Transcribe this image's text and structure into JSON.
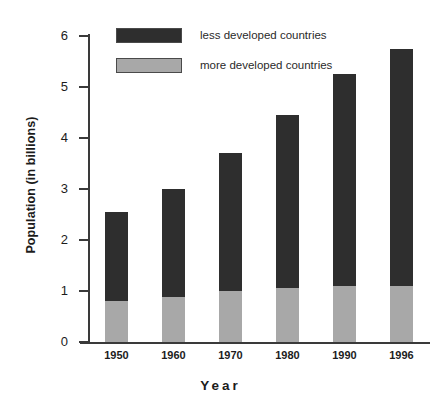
{
  "chart_data": {
    "type": "bar",
    "subtype": "stacked",
    "title": "",
    "xlabel": "Year",
    "ylabel": "Population (in billions)",
    "categories": [
      "1950",
      "1960",
      "1970",
      "1980",
      "1990",
      "1996"
    ],
    "ylim": [
      0,
      6
    ],
    "yticks": [
      "0",
      "1",
      "2",
      "3",
      "4",
      "5",
      "6"
    ],
    "grid": false,
    "legend_position": "top-left",
    "series": [
      {
        "name": "more developed countries",
        "color": "#a8a8a8",
        "values": [
          0.8,
          0.88,
          1.0,
          1.05,
          1.1,
          1.1
        ]
      },
      {
        "name": "less developed countries",
        "color": "#2e2e2e",
        "values": [
          1.75,
          2.12,
          2.7,
          3.4,
          4.15,
          4.65
        ]
      }
    ],
    "totals": [
      2.55,
      3.0,
      3.7,
      4.45,
      5.25,
      5.75
    ]
  },
  "legend": {
    "items": [
      {
        "label": "less developed countries",
        "color": "#2e2e2e"
      },
      {
        "label": "more developed countries",
        "color": "#a8a8a8"
      }
    ]
  },
  "colors": {
    "less_developed": "#2e2e2e",
    "more_developed": "#a8a8a8",
    "axis": "#3a3a3a",
    "background": "#ffffff",
    "text": "#1c1c1c"
  }
}
